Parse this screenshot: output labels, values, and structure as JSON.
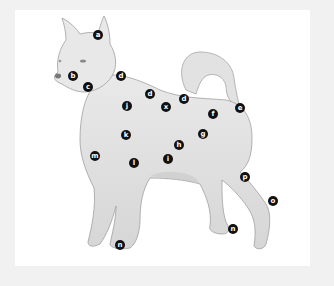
{
  "diagram": {
    "colors": {
      "background": "#f1f1f1",
      "panel": "#ffffff",
      "marker_fill": "#111111",
      "marker_text": "#ffffff",
      "dog_fill": "#e4e4e4",
      "dog_stroke": "#9a9a9a"
    },
    "markers": [
      {
        "label": "a",
        "x": 98,
        "y": 35
      },
      {
        "label": "b",
        "x": 73,
        "y": 76
      },
      {
        "label": "c",
        "x": 88,
        "y": 87
      },
      {
        "label": "d",
        "x": 121,
        "y": 76
      },
      {
        "label": "d",
        "x": 150,
        "y": 94
      },
      {
        "label": "d",
        "x": 184,
        "y": 99
      },
      {
        "label": "x",
        "x": 166,
        "y": 107
      },
      {
        "label": "e",
        "x": 240,
        "y": 108
      },
      {
        "label": "f",
        "x": 213,
        "y": 114
      },
      {
        "label": "j",
        "x": 127,
        "y": 106
      },
      {
        "label": "k",
        "x": 126,
        "y": 135
      },
      {
        "label": "g",
        "x": 203,
        "y": 134
      },
      {
        "label": "h",
        "x": 179,
        "y": 145
      },
      {
        "label": "i",
        "x": 168,
        "y": 159
      },
      {
        "label": "l",
        "x": 134,
        "y": 163
      },
      {
        "label": "m",
        "x": 95,
        "y": 156
      },
      {
        "label": "p",
        "x": 245,
        "y": 177
      },
      {
        "label": "o",
        "x": 273,
        "y": 201
      },
      {
        "label": "n",
        "x": 233,
        "y": 229
      },
      {
        "label": "n",
        "x": 120,
        "y": 245
      }
    ]
  }
}
